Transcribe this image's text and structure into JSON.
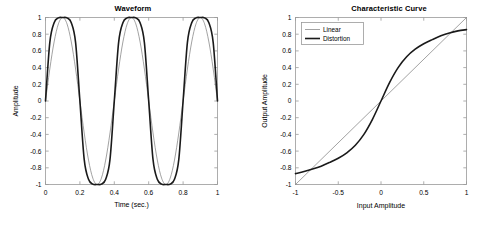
{
  "figure": {
    "background": "#ffffff",
    "axis_color": "#9a9a9a",
    "linear_color": "#7a7a7a",
    "distortion_color": "#1a1a1a"
  },
  "panels": [
    {
      "key": "waveform",
      "title": "Waveform",
      "xlabel": "Time (sec.)",
      "ylabel": "Amplitude"
    },
    {
      "key": "characteristic",
      "title": "Characteristic Curve",
      "xlabel": "Input Amplitude",
      "ylabel": "Output Amplitude"
    }
  ],
  "legend": {
    "items": [
      {
        "label": "Linear",
        "color": "#7a7a7a",
        "width": 0.7
      },
      {
        "label": "Distortion",
        "color": "#1a1a1a",
        "width": 1.6
      }
    ]
  },
  "chart_data": [
    {
      "type": "line",
      "key": "waveform",
      "title": "Waveform",
      "xlabel": "Time (sec.)",
      "ylabel": "Amplitude",
      "xlim": [
        0,
        1
      ],
      "ylim": [
        -1,
        1
      ],
      "xticks": [
        0,
        0.2,
        0.4,
        0.6,
        0.8,
        1
      ],
      "xticklabels": [
        "0",
        "0.2",
        "0.4",
        "0.6",
        "0.8",
        "1"
      ],
      "yticks": [
        -1,
        -0.8,
        -0.6,
        -0.4,
        -0.2,
        0,
        0.2,
        0.4,
        0.6,
        0.8,
        1
      ],
      "yticklabels": [
        "-1",
        "-0.8",
        "-0.6",
        "-0.4",
        "-0.2",
        "0",
        "0.2",
        "0.4",
        "0.6",
        "0.8",
        "1"
      ],
      "grid": false,
      "legend": null,
      "series": [
        {
          "name": "Linear",
          "color": "#7a7a7a",
          "linewidth": 0.7,
          "description": "Clean sine wave, 2 cycles over 1 second, amplitude 1",
          "formula": "y = sin(2*pi*2*t)",
          "x": [
            0,
            0.025,
            0.05,
            0.075,
            0.1,
            0.125,
            0.15,
            0.175,
            0.2,
            0.225,
            0.25,
            0.275,
            0.3,
            0.325,
            0.35,
            0.375,
            0.4,
            0.425,
            0.45,
            0.475,
            0.5,
            0.525,
            0.55,
            0.575,
            0.6,
            0.625,
            0.65,
            0.675,
            0.7,
            0.725,
            0.75,
            0.775,
            0.8,
            0.825,
            0.85,
            0.875,
            0.9,
            0.925,
            0.95,
            0.975,
            1
          ],
          "y": [
            0,
            0.383,
            0.707,
            0.924,
            1,
            0.924,
            0.707,
            0.383,
            0,
            -0.383,
            -0.707,
            -0.924,
            -1,
            -0.924,
            -0.707,
            -0.383,
            0,
            0.383,
            0.707,
            0.924,
            1,
            0.924,
            0.707,
            0.383,
            0,
            -0.383,
            -0.707,
            -0.924,
            -1,
            -0.924,
            -0.707,
            -0.383,
            0,
            0.383,
            0.707,
            0.924,
            1,
            0.924,
            0.707,
            0.383,
            0
          ]
        },
        {
          "name": "Distortion",
          "color": "#1a1a1a",
          "linewidth": 1.6,
          "description": "Soft-clipped (saturated) sine wave, flattened peaks near 0.86",
          "formula": "y = tanh(2.2*sin(2*pi*2*t)) / tanh(2.2)",
          "peak_positive": 0.86,
          "peak_negative": -0.87,
          "x": [
            0,
            0.025,
            0.05,
            0.075,
            0.1,
            0.125,
            0.15,
            0.175,
            0.2,
            0.225,
            0.25,
            0.275,
            0.3,
            0.325,
            0.35,
            0.375,
            0.4,
            0.425,
            0.45,
            0.475,
            0.5,
            0.525,
            0.55,
            0.575,
            0.6,
            0.625,
            0.65,
            0.675,
            0.7,
            0.725,
            0.75,
            0.775,
            0.8,
            0.825,
            0.85,
            0.875,
            0.9,
            0.925,
            0.95,
            0.975,
            1
          ],
          "y": [
            0,
            0.7,
            0.937,
            0.995,
            1,
            0.995,
            0.937,
            0.7,
            0,
            -0.7,
            -0.937,
            -0.995,
            -1,
            -0.995,
            -0.937,
            -0.7,
            0,
            0.7,
            0.937,
            0.995,
            1,
            0.995,
            0.937,
            0.7,
            0,
            -0.7,
            -0.937,
            -0.995,
            -1,
            -0.995,
            -0.937,
            -0.7,
            0,
            0.7,
            0.937,
            0.995,
            1,
            0.995,
            0.937,
            0.7,
            0
          ]
        }
      ]
    },
    {
      "type": "line",
      "key": "characteristic",
      "title": "Characteristic Curve",
      "xlabel": "Input Amplitude",
      "ylabel": "Output Amplitude",
      "xlim": [
        -1,
        1
      ],
      "ylim": [
        -1,
        1
      ],
      "xticks": [
        -1,
        -0.5,
        0,
        0.5,
        1
      ],
      "xticklabels": [
        "-1",
        "-0.5",
        "0",
        "0.5",
        "1"
      ],
      "yticks": [
        -1,
        -0.8,
        -0.6,
        -0.4,
        -0.2,
        0,
        0.2,
        0.4,
        0.6,
        0.8,
        1
      ],
      "yticklabels": [
        "-1",
        "-0.8",
        "-0.6",
        "-0.4",
        "-0.2",
        "0",
        "0.2",
        "0.4",
        "0.6",
        "0.8",
        "1"
      ],
      "grid": false,
      "legend": {
        "position": "top-left",
        "entries": [
          "Linear",
          "Distortion"
        ]
      },
      "series": [
        {
          "name": "Linear",
          "color": "#7a7a7a",
          "linewidth": 0.7,
          "description": "Identity transfer function, straight diagonal line",
          "formula": "y = x",
          "x": [
            -1,
            1
          ],
          "y": [
            -1,
            1
          ]
        },
        {
          "name": "Distortion",
          "color": "#1a1a1a",
          "linewidth": 1.6,
          "description": "Saturating S-shaped transfer curve, compresses toward +/-0.86",
          "formula": "y = tanh(2.2*x)/tanh(2.2) shaped with gentle shoulders",
          "endpoint_low": -0.87,
          "endpoint_high": 0.855,
          "x": [
            -1,
            -0.9,
            -0.8,
            -0.7,
            -0.6,
            -0.5,
            -0.4,
            -0.3,
            -0.2,
            -0.1,
            0,
            0.1,
            0.2,
            0.3,
            0.4,
            0.5,
            0.6,
            0.7,
            0.8,
            0.9,
            1
          ],
          "y": [
            -0.87,
            -0.845,
            -0.815,
            -0.78,
            -0.735,
            -0.685,
            -0.62,
            -0.53,
            -0.4,
            -0.22,
            0,
            0.22,
            0.4,
            0.53,
            0.62,
            0.685,
            0.735,
            0.78,
            0.815,
            0.84,
            0.855
          ]
        }
      ]
    }
  ]
}
